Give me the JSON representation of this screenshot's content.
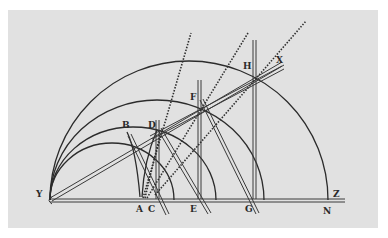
{
  "figure": {
    "type": "geometric-construction-engraving",
    "background_color": "#e1e1e1",
    "ink_color": "#2b2b2b",
    "labels": {
      "Y": "Y",
      "A": "A",
      "C": "C",
      "E": "E",
      "G": "G",
      "N": "N",
      "Z": "Z",
      "B": "B",
      "D": "D",
      "F": "F",
      "H": "H",
      "X": "X"
    }
  }
}
